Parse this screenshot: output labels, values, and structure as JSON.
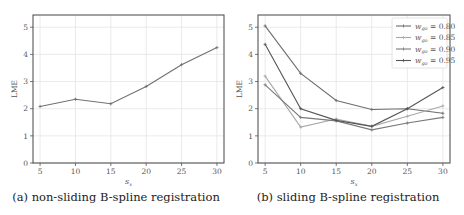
{
  "chart_data": [
    {
      "type": "line",
      "title": "",
      "caption": "(a) non-sliding B-spline registration",
      "xlabel": "s_x",
      "ylabel": "LME",
      "x": [
        5,
        10,
        15,
        20,
        25,
        30
      ],
      "xticks": [
        5,
        10,
        15,
        20,
        25,
        30
      ],
      "yticks": [
        0,
        1,
        2,
        3,
        4,
        5
      ],
      "ylim": [
        0,
        5.45
      ],
      "xlim": [
        4,
        31
      ],
      "grid": true,
      "series": [
        {
          "name": "non-sliding",
          "color": "#707070",
          "values": [
            2.08,
            2.35,
            2.18,
            2.82,
            3.62,
            4.25
          ]
        }
      ]
    },
    {
      "type": "line",
      "title": "",
      "caption": "(b) sliding B-spline registration",
      "xlabel": "s_x",
      "ylabel": "LME",
      "x": [
        5,
        10,
        15,
        20,
        25,
        30
      ],
      "xticks": [
        5,
        10,
        15,
        20,
        25,
        30
      ],
      "yticks": [
        0,
        1,
        2,
        3,
        4,
        5
      ],
      "ylim": [
        0,
        5.45
      ],
      "xlim": [
        4,
        31
      ],
      "grid": true,
      "legend_position": "upper right",
      "series": [
        {
          "name": "w_go = 0.80",
          "color": "#6e6e6e",
          "values": [
            5.05,
            3.3,
            2.3,
            1.97,
            2.0,
            1.83
          ]
        },
        {
          "name": "w_go = 0.85",
          "color": "#a8a8a8",
          "values": [
            3.2,
            1.32,
            1.62,
            1.35,
            1.72,
            2.1
          ]
        },
        {
          "name": "w_go = 0.90",
          "color": "#7a7a7a",
          "values": [
            2.88,
            1.68,
            1.55,
            1.22,
            1.47,
            1.68
          ]
        },
        {
          "name": "w_go = 0.95",
          "color": "#555555",
          "values": [
            4.37,
            2.0,
            1.57,
            1.35,
            2.0,
            2.78
          ]
        }
      ]
    }
  ],
  "panels": {
    "a": {
      "caption": "(a) non-sliding B-spline registration",
      "ylabel": "LME",
      "xlabel": "s"
    },
    "b": {
      "caption": "(b) sliding B-spline registration",
      "ylabel": "LME",
      "xlabel": "s",
      "legend": [
        "w = 0.80",
        "w = 0.85",
        "w = 0.90",
        "w = 0.95"
      ]
    }
  }
}
